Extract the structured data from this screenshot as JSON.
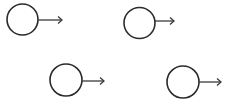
{
  "diagram": {
    "background": "#ffffff",
    "stroke_color": "#2a2a2a",
    "stroke_width": 1.6,
    "arrow_color": "#3a3a3a",
    "arrow_width": 1.3,
    "elements": [
      {
        "id": "object-1",
        "shape": "circle",
        "cx": 22.5,
        "cy": 19.5,
        "r": 15.5,
        "arrow": {
          "x1": 38,
          "y1": 20,
          "x2": 62,
          "y2": 20,
          "direction": "right"
        }
      },
      {
        "id": "object-2",
        "shape": "circle",
        "cx": 139.5,
        "cy": 23,
        "r": 15.5,
        "arrow": {
          "x1": 155,
          "y1": 21,
          "x2": 174,
          "y2": 21,
          "direction": "right"
        }
      },
      {
        "id": "object-3",
        "shape": "circle",
        "cx": 66,
        "cy": 80,
        "r": 16,
        "arrow": {
          "x1": 82,
          "y1": 81,
          "x2": 104,
          "y2": 81,
          "direction": "right"
        }
      },
      {
        "id": "object-4",
        "shape": "circle",
        "cx": 183,
        "cy": 82,
        "r": 16,
        "arrow": {
          "x1": 199,
          "y1": 82,
          "x2": 221,
          "y2": 82,
          "direction": "right"
        }
      }
    ]
  }
}
